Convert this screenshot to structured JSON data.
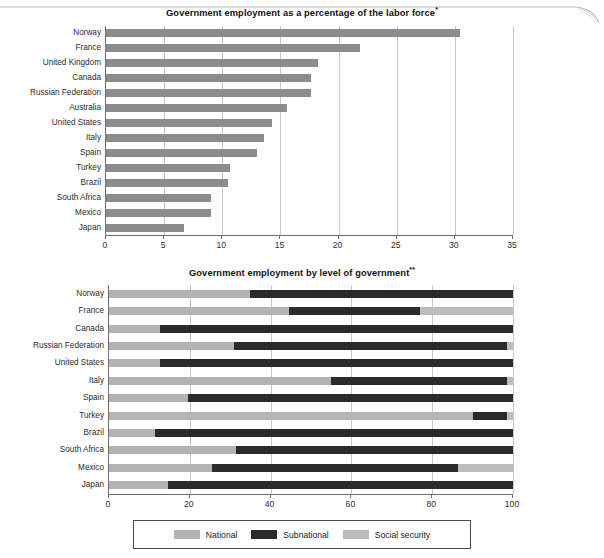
{
  "figure": {
    "background": "#ffffff"
  },
  "colors": {
    "national": "#b3b3b3",
    "subnational": "#2b2b2b",
    "social_security": "#bdbdbd",
    "bar_gray": "#8c8c8c",
    "axis": "#6e6e6e",
    "grid": "#c8c8c8",
    "text": "#1a1a1a"
  },
  "chart_data": [
    {
      "type": "bar",
      "id": "top-chart",
      "orientation": "horizontal",
      "title": "Government employment as a percentage of the labor force",
      "title_superscript": "*",
      "xlabel": "",
      "ylabel": "",
      "xlim": [
        0,
        35
      ],
      "xticks": [
        0,
        5,
        10,
        15,
        20,
        25,
        30,
        35
      ],
      "xtick_labels": [
        "0",
        "5",
        "10",
        "15",
        "20",
        "25",
        "30",
        "35"
      ],
      "grid": true,
      "legend": false,
      "bar_color": "#8c8c8c",
      "categories": [
        "Norway",
        "France",
        "United Kingdom",
        "Canada",
        "Russian Federation",
        "Australia",
        "United States",
        "Italy",
        "Spain",
        "Turkey",
        "Brazil",
        "South Africa",
        "Mexico",
        "Japan"
      ],
      "values": [
        30.4,
        21.8,
        18.2,
        17.6,
        17.6,
        15.6,
        14.3,
        13.6,
        13.0,
        10.7,
        10.5,
        9.0,
        9.0,
        6.7
      ]
    },
    {
      "type": "bar",
      "id": "bottom-chart",
      "orientation": "horizontal",
      "stacked": true,
      "title": "Government employment by level of government",
      "title_superscript": "**",
      "xlabel": "",
      "ylabel": "",
      "xlim": [
        0,
        100
      ],
      "xticks": [
        0,
        20,
        40,
        60,
        80,
        100
      ],
      "xtick_labels": [
        "0",
        "20",
        "40",
        "60",
        "80",
        "100"
      ],
      "grid": true,
      "legend": true,
      "legend_position": "bottom",
      "categories": [
        "Norway",
        "France",
        "Canada",
        "Russian Federation",
        "United States",
        "Italy",
        "Spain",
        "Turkey",
        "Brazil",
        "South Africa",
        "Mexico",
        "Japan"
      ],
      "series": [
        {
          "name": "National",
          "color": "#b3b3b3",
          "values": [
            35.0,
            44.5,
            12.5,
            31.0,
            12.5,
            55.0,
            19.5,
            90.0,
            11.5,
            31.5,
            25.5,
            14.5
          ]
        },
        {
          "name": "Subnational",
          "color": "#2b2b2b",
          "values": [
            65.0,
            32.5,
            87.5,
            67.5,
            87.5,
            43.5,
            80.5,
            8.5,
            88.5,
            68.5,
            61.0,
            85.5
          ]
        },
        {
          "name": "Social security",
          "color": "#bdbdbd",
          "values": [
            0.0,
            23.0,
            0.0,
            1.5,
            0.0,
            1.5,
            0.0,
            1.5,
            0.0,
            0.0,
            13.5,
            0.0
          ]
        }
      ]
    }
  ],
  "legend": {
    "items": [
      {
        "label": "National",
        "color": "#b3b3b3"
      },
      {
        "label": "Subnational",
        "color": "#2b2b2b"
      },
      {
        "label": "Social security",
        "color": "#bdbdbd"
      }
    ]
  }
}
